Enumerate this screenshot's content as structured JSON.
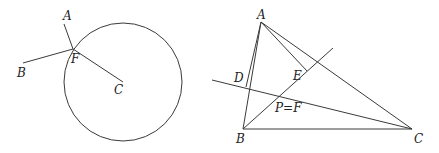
{
  "figures": [
    {
      "name": "circle-figure",
      "circle": {
        "cx": 123,
        "cy": 82,
        "r": 59
      },
      "segments": [
        {
          "name": "segment-af",
          "x1": 64,
          "y1": 24,
          "x2": 73,
          "y2": 49
        },
        {
          "name": "segment-bf",
          "x1": 23,
          "y1": 63,
          "x2": 73,
          "y2": 49
        },
        {
          "name": "segment-fc",
          "x1": 73,
          "y1": 49,
          "x2": 123,
          "y2": 82
        }
      ],
      "labels": [
        {
          "name": "label-a",
          "text": "A",
          "x": 63,
          "y": 20
        },
        {
          "name": "label-b",
          "text": "B",
          "x": 17,
          "y": 77
        },
        {
          "name": "label-f",
          "text": "F",
          "x": 71,
          "y": 63
        },
        {
          "name": "label-c",
          "text": "C",
          "x": 114,
          "y": 94
        }
      ]
    },
    {
      "name": "triangle-figure",
      "segments": [
        {
          "name": "side-ab",
          "x1": 261,
          "y1": 22,
          "x2": 243,
          "y2": 129
        },
        {
          "name": "side-bc",
          "x1": 243,
          "y1": 129,
          "x2": 412,
          "y2": 129
        },
        {
          "name": "side-ac",
          "x1": 261,
          "y1": 22,
          "x2": 412,
          "y2": 129
        },
        {
          "name": "segment-ad",
          "x1": 261,
          "y1": 22,
          "x2": 246,
          "y2": 87
        },
        {
          "name": "segment-ae",
          "x1": 261,
          "y1": 22,
          "x2": 307,
          "y2": 71
        },
        {
          "name": "line-dc",
          "x1": 212,
          "y1": 80,
          "x2": 412,
          "y2": 129
        },
        {
          "name": "line-be",
          "x1": 243,
          "y1": 129,
          "x2": 333,
          "y2": 48
        }
      ],
      "labels": [
        {
          "name": "label-a",
          "text": "A",
          "x": 257,
          "y": 19
        },
        {
          "name": "label-d",
          "text": "D",
          "x": 234,
          "y": 82
        },
        {
          "name": "label-e",
          "text": "E",
          "x": 293,
          "y": 80
        },
        {
          "name": "label-pf",
          "text": "P=F",
          "x": 275,
          "y": 112
        },
        {
          "name": "label-b",
          "text": "B",
          "x": 236,
          "y": 143
        },
        {
          "name": "label-c",
          "text": "C",
          "x": 414,
          "y": 143
        }
      ]
    }
  ]
}
